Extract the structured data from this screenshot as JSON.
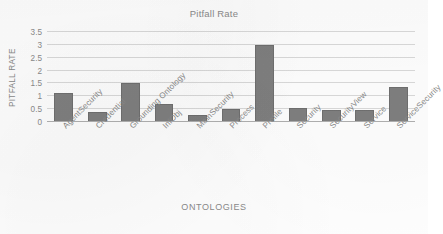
{
  "chart_data": {
    "type": "bar",
    "title": "Pitfall Rate",
    "xlabel": "ONTOLOGIES",
    "ylabel": "PITFALL RATE",
    "categories": [
      "AgentSecurity",
      "Credential",
      "Grounding Ontology",
      "InfObj",
      "MainSecurity",
      "Process",
      "Profile",
      "Security",
      "SecurityView",
      "Service",
      "ServiceSecurity"
    ],
    "values": [
      1.12,
      0.38,
      1.5,
      0.72,
      0.27,
      0.5,
      3.0,
      0.53,
      0.47,
      0.47,
      1.37
    ],
    "ylim": [
      0,
      3.5
    ],
    "yticks": [
      0,
      0.5,
      1,
      1.5,
      2,
      2.5,
      3,
      3.5
    ],
    "ytick_labels": [
      "0",
      "0.5",
      "1",
      "1.5",
      "2",
      "2.5",
      "3",
      "3.5"
    ],
    "grid": true,
    "legend": false,
    "series_color": "#7f7f7f",
    "gridline_color": "#d9d9d9",
    "text_color": "#8a8a8a"
  }
}
